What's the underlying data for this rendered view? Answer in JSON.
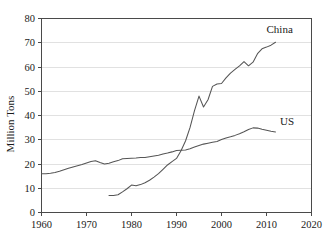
{
  "chart_data": {
    "type": "line",
    "title": "",
    "xlabel": "",
    "ylabel": "Million Tons",
    "xlim": [
      1960,
      2020
    ],
    "ylim": [
      0,
      80
    ],
    "xticks": [
      1960,
      1970,
      1980,
      1990,
      2000,
      2010,
      2020
    ],
    "yticks": [
      0,
      10,
      20,
      30,
      40,
      50,
      60,
      70,
      80
    ],
    "grid": "horizontal",
    "legend_position": "inline-end-of-line",
    "line_color": "#555555",
    "grid_color": "#d9d9d9",
    "frame_color": "#4a4a4a",
    "series": [
      {
        "name": "China",
        "label": "China",
        "label_x": 2010,
        "label_y": 74,
        "x": [
          1975,
          1976,
          1977,
          1978,
          1979,
          1980,
          1981,
          1982,
          1983,
          1984,
          1985,
          1986,
          1987,
          1988,
          1989,
          1990,
          1991,
          1992,
          1993,
          1994,
          1995,
          1996,
          1997,
          1998,
          1999,
          2000,
          2001,
          2002,
          2003,
          2004,
          2005,
          2006,
          2007,
          2008,
          2009,
          2010,
          2011,
          2012
        ],
        "values": [
          7.0,
          7.0,
          7.3,
          8.5,
          9.8,
          11.3,
          11.0,
          11.5,
          12.3,
          13.3,
          14.6,
          16.0,
          17.8,
          19.6,
          21.0,
          22.3,
          25.5,
          29.5,
          35.0,
          42.0,
          48.0,
          43.5,
          46.5,
          52.0,
          53.0,
          53.2,
          55.5,
          57.5,
          59.0,
          60.5,
          62.2,
          60.5,
          62.0,
          65.5,
          67.5,
          68.2,
          69.0,
          70.2
        ]
      },
      {
        "name": "US",
        "label": "US",
        "label_x": 2013,
        "label_y": 36,
        "x": [
          1960,
          1961,
          1962,
          1963,
          1964,
          1965,
          1966,
          1967,
          1968,
          1969,
          1970,
          1971,
          1972,
          1973,
          1974,
          1975,
          1976,
          1977,
          1978,
          1979,
          1980,
          1981,
          1982,
          1983,
          1984,
          1985,
          1986,
          1987,
          1988,
          1989,
          1990,
          1991,
          1992,
          1993,
          1994,
          1995,
          1996,
          1997,
          1998,
          1999,
          2000,
          2001,
          2002,
          2003,
          2004,
          2005,
          2006,
          2007,
          2008,
          2009,
          2010,
          2011,
          2012
        ],
        "values": [
          16.0,
          16.0,
          16.2,
          16.5,
          17.0,
          17.6,
          18.2,
          18.8,
          19.3,
          19.8,
          20.4,
          21.0,
          21.3,
          20.6,
          20.0,
          20.3,
          20.9,
          21.4,
          22.2,
          22.3,
          22.4,
          22.5,
          22.7,
          22.7,
          23.0,
          23.3,
          23.6,
          24.1,
          24.5,
          25.0,
          25.6,
          25.7,
          25.8,
          26.3,
          27.0,
          27.6,
          28.2,
          28.6,
          29.0,
          29.3,
          30.1,
          30.7,
          31.2,
          31.8,
          32.5,
          33.3,
          34.2,
          34.9,
          34.8,
          34.3,
          33.9,
          33.5,
          33.2
        ]
      }
    ]
  },
  "axis": {
    "y_title": "Million Tons",
    "y_tick_labels": [
      "0",
      "10",
      "20",
      "30",
      "40",
      "50",
      "60",
      "70",
      "80"
    ],
    "x_tick_labels": [
      "1960",
      "1970",
      "1980",
      "1990",
      "2000",
      "2010",
      "2020"
    ]
  },
  "labels": {
    "china": "China",
    "us": "US"
  }
}
